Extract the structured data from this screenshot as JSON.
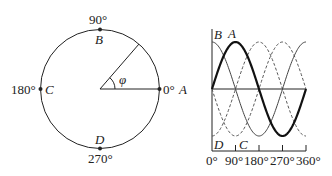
{
  "phasor_circle": {
    "points": [
      {
        "id": "A",
        "angle_label": "0°"
      },
      {
        "id": "B",
        "angle_label": "90°"
      },
      {
        "id": "C",
        "angle_label": "180°"
      },
      {
        "id": "D",
        "angle_label": "270°"
      }
    ],
    "angle_symbol": "φ"
  },
  "waveform": {
    "curve_labels": {
      "A": "A",
      "B": "B",
      "C": "C",
      "D": "D"
    },
    "x_ticks": [
      "0°",
      "90°",
      "180°",
      "270°",
      "360°"
    ]
  },
  "colors": {
    "stroke": "#222222",
    "background": "#ffffff"
  }
}
